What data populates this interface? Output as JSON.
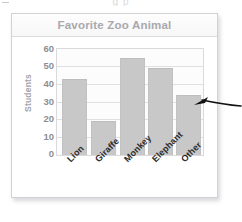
{
  "page": {
    "top_cut_text": "g p"
  },
  "card": {
    "title": "Favorite Zoo Animal"
  },
  "annotation": {
    "arrow_icon": "arrow-left-pointer",
    "points_at": "Other"
  },
  "chart_data": {
    "type": "bar",
    "title": "Favorite Zoo Animal",
    "xlabel": "",
    "ylabel": "Students",
    "categories": [
      "Lion",
      "Giraffe",
      "Monkey",
      "Elephant",
      "Other"
    ],
    "values": [
      43,
      19,
      55,
      49,
      34
    ],
    "ylim": [
      0,
      60
    ],
    "ytick_labels": [
      "60",
      "50",
      "40",
      "30",
      "20",
      "10",
      "0"
    ],
    "yticks": [
      60,
      50,
      40,
      30,
      20,
      10,
      0
    ],
    "grid": true,
    "legend": false,
    "bar_color": "#c8c8c8",
    "title_color": "#a8a8ad",
    "axis_label_color": "#a5a5aa",
    "tick_color": "#8e8e93",
    "plot_background": "#fcfcfc",
    "gridline_color": "#e0e0e4"
  }
}
